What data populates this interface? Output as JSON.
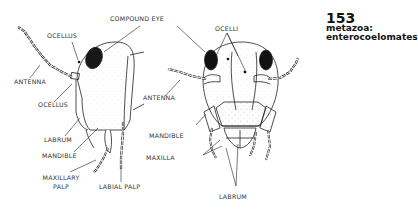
{
  "header": {
    "number": "153",
    "line1": "metazoa:",
    "line2": "enterocoelomates"
  },
  "side_view_labels": {
    "compound_eye": "COMPOUND EYE",
    "ocellus_top": "OCELLUS",
    "antenna": "ANTENNA",
    "ocellus_bottom": "OCELLUS",
    "labrum": "LABRUM",
    "mandible": "MANDIBLE",
    "maxillary_palp_1": "MAXILLARY",
    "maxillary_palp_2": "PALP",
    "labial_palp": "LABIAL PALP"
  },
  "front_view_labels": {
    "ocelli": "OCELLI",
    "antenna": "ANTENNA",
    "mandible": "MANDIBLE",
    "maxilla": "MAXILLA",
    "labrum": "LABRUM"
  },
  "colors": {
    "line": "#222222",
    "text": "#333333",
    "title": "#111111"
  }
}
